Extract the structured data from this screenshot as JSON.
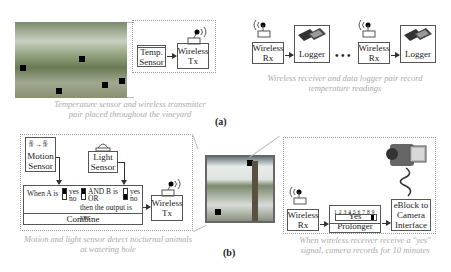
{
  "part_a": {
    "label": "(a)",
    "left_caption": [
      "Temperature sensor and wireless transmitter",
      "pair placed throughout the vineyard"
    ],
    "right_caption": [
      "Wireless receiver and data logger pair record",
      "temperature readings"
    ],
    "temp_sensor": [
      "Temp.",
      "Sensor"
    ],
    "wireless_tx": [
      "Wireless",
      "Tx"
    ],
    "wireless_rx": [
      "Wireless",
      "Rx"
    ],
    "logger": "Logger",
    "ellipsis": "• • •"
  },
  "part_b": {
    "label": "(b)",
    "left_caption": [
      "Motion and light sensor detect nocturnal animals",
      "at watering hole"
    ],
    "right_caption": [
      "When wireless receiver receive a \"yes\"",
      "signal, camera records for 10 minutes"
    ],
    "motion_sensor": [
      "Motion",
      "Sensor"
    ],
    "light_sensor": [
      "Light",
      "Sensor"
    ],
    "combine": {
      "when_a": "When A is",
      "yes": "yes",
      "no": "no",
      "and": "AND",
      "or": "OR",
      "b_is": "B is",
      "then": "then the output is yes",
      "title": "Combine"
    },
    "wireless_tx": [
      "Wireless",
      "Tx"
    ],
    "wireless_rx": [
      "Wireless",
      "Rx"
    ],
    "prolonger": {
      "scale": "1 2 3 4 5 6 7 8 9",
      "title": "Yes Prolonger"
    },
    "camera_interface": [
      "eBlock to",
      "Camera",
      "Interface"
    ]
  }
}
